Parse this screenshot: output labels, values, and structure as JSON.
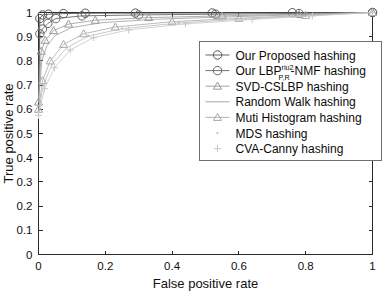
{
  "chart_data": {
    "type": "line",
    "title": "",
    "xlabel": "False positive rate",
    "ylabel": "True positive rate",
    "xlim": [
      0,
      1
    ],
    "ylim": [
      0,
      1
    ],
    "xticks": [
      "0",
      "0.2",
      "0.4",
      "0.6",
      "0.8",
      "1"
    ],
    "xtick_values": [
      0,
      0.2,
      0.4,
      0.6,
      0.8,
      1
    ],
    "yticks": [
      "0",
      "0.1",
      "0.2",
      "0.3",
      "0.4",
      "0.5",
      "0.6",
      "0.7",
      "0.8",
      "0.9",
      "1"
    ],
    "ytick_values": [
      0,
      0.1,
      0.2,
      0.3,
      0.4,
      0.5,
      0.6,
      0.7,
      0.8,
      0.9,
      1
    ],
    "grid": false,
    "legend_position": "center-right",
    "series": [
      {
        "name": "Our Proposed hashing",
        "marker": "circle",
        "color": "#555555",
        "x": [
          0,
          0.004,
          0.012,
          0.03,
          0.075,
          0.14,
          0.29,
          0.52,
          0.76,
          1
        ],
        "y": [
          0.655,
          0.975,
          0.99,
          0.993,
          0.9955,
          0.997,
          0.9975,
          0.998,
          0.999,
          1
        ]
      },
      {
        "name": "Our LBP_P,R^riu2-NMF hashing",
        "marker": "circle",
        "color": "#666666",
        "x": [
          0,
          0.004,
          0.012,
          0.028,
          0.052,
          0.13,
          0.3,
          0.53,
          0.78,
          1
        ],
        "y": [
          0.63,
          0.912,
          0.932,
          0.955,
          0.975,
          0.986,
          0.99,
          0.993,
          0.996,
          1
        ]
      },
      {
        "name": "SVD-CSLBP hashing",
        "marker": "triangle",
        "color": "#999999",
        "x": [
          0,
          0.008,
          0.02,
          0.045,
          0.09,
          0.17,
          0.33,
          0.55,
          0.78,
          1
        ],
        "y": [
          0.63,
          0.84,
          0.885,
          0.925,
          0.952,
          0.968,
          0.979,
          0.986,
          0.993,
          1
        ]
      },
      {
        "name": "Random Walk hashing",
        "marker": "none",
        "color": "#9e9e9e",
        "x": [
          0,
          0.01,
          0.025,
          0.05,
          0.1,
          0.19,
          0.35,
          0.57,
          0.79,
          1
        ],
        "y": [
          0.63,
          0.8,
          0.862,
          0.905,
          0.938,
          0.958,
          0.972,
          0.982,
          0.991,
          1
        ]
      },
      {
        "name": "Muti Histogram hashing",
        "marker": "triangle",
        "color": "#a8a8a8",
        "x": [
          0,
          0.012,
          0.035,
          0.075,
          0.135,
          0.23,
          0.4,
          0.6,
          0.8,
          1
        ],
        "y": [
          0.6,
          0.718,
          0.8,
          0.868,
          0.912,
          0.94,
          0.962,
          0.976,
          0.988,
          1
        ]
      },
      {
        "name": "MDS hashing",
        "marker": "dot",
        "color": "#bcbcbc",
        "x": [
          0,
          0.015,
          0.04,
          0.085,
          0.15,
          0.25,
          0.42,
          0.62,
          0.81,
          1
        ],
        "y": [
          0.59,
          0.7,
          0.785,
          0.855,
          0.903,
          0.933,
          0.957,
          0.973,
          0.987,
          1
        ]
      },
      {
        "name": "CVA-Canny hashing",
        "marker": "plus",
        "color": "#c8c8c8",
        "x": [
          0,
          0.018,
          0.048,
          0.095,
          0.165,
          0.27,
          0.44,
          0.64,
          0.82,
          1
        ],
        "y": [
          0.575,
          0.685,
          0.772,
          0.845,
          0.896,
          0.928,
          0.953,
          0.971,
          0.986,
          1
        ]
      }
    ]
  },
  "legend": {
    "entries": [
      {
        "label": "Our Proposed hashing"
      },
      {
        "label_pre": "Our LBP",
        "label_sup": "riu2",
        "label_sub": "P,R",
        "label_post": "-NMF hashing"
      },
      {
        "label": "SVD-CSLBP hashing"
      },
      {
        "label": "Random Walk hashing"
      },
      {
        "label": "Muti Histogram hashing"
      },
      {
        "label": "MDS hashing"
      },
      {
        "label": "CVA-Canny hashing"
      }
    ]
  }
}
